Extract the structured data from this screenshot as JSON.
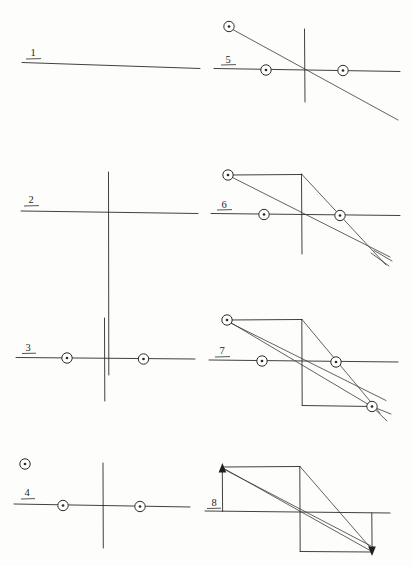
{
  "sheet": {
    "title": "Geometric construction sequence",
    "background_color": "#fdfdfc",
    "ink_color": "#2b2b2b",
    "width": 412,
    "height": 566,
    "media": "hand-drawn pencil on paper, scanned"
  },
  "panels": [
    {
      "label": "1",
      "label_x": 33,
      "label_y": 55,
      "name": "panel-1",
      "description": "single horizontal reference line",
      "elements": [
        "horizontal-axis"
      ]
    },
    {
      "label": "2",
      "label_x": 29,
      "label_y": 201,
      "name": "panel-2",
      "description": "horizontal line crossed by a vertical line",
      "elements": [
        "horizontal-axis",
        "vertical-axis"
      ]
    },
    {
      "label": "3",
      "label_x": 27,
      "label_y": 349,
      "name": "panel-3",
      "description": "axes plus two circled point markers on the horizontal line",
      "elements": [
        "horizontal-axis",
        "vertical-axis",
        "marker-left",
        "marker-right"
      ]
    },
    {
      "label": "4",
      "label_x": 27,
      "label_y": 494,
      "name": "panel-4",
      "description": "axes, two circled markers on the line, plus one free circled marker above left",
      "elements": [
        "horizontal-axis",
        "vertical-axis",
        "marker-left",
        "marker-right",
        "marker-floating"
      ]
    },
    {
      "label": "5",
      "label_x": 228,
      "label_y": 62,
      "name": "panel-5",
      "description": "axes with three circled markers and one oblique line through the origin",
      "elements": [
        "horizontal-axis",
        "vertical-axis",
        "oblique-line",
        "marker-upper-left",
        "marker-left",
        "marker-right"
      ]
    },
    {
      "label": "6",
      "label_x": 224,
      "label_y": 211,
      "name": "panel-6",
      "description": "adds a top horizontal edge and a second converging oblique line",
      "elements": [
        "horizontal-axis",
        "vertical-axis",
        "top-edge",
        "oblique-line-a",
        "oblique-line-b",
        "marker-upper-left",
        "marker-left",
        "marker-right"
      ]
    },
    {
      "label": "7",
      "label_x": 222,
      "label_y": 355,
      "name": "panel-7",
      "description": "closed parallelogram with crossing diagonals and four circled markers",
      "elements": [
        "horizontal-axis",
        "vertical-edge",
        "top-edge",
        "bottom-edge",
        "diagonal-a",
        "diagonal-b",
        "diagonal-c",
        "marker-upper-left",
        "marker-left",
        "marker-right",
        "marker-lower-right"
      ]
    },
    {
      "label": "8",
      "label_x": 214,
      "label_y": 505,
      "name": "panel-8",
      "description": "same parallelogram with vector arrowheads replacing the circled markers",
      "elements": [
        "horizontal-axis",
        "vertical-edge",
        "top-edge",
        "bottom-edge",
        "diagonal-a",
        "diagonal-b",
        "diagonal-c",
        "arrow-up",
        "arrow-down"
      ]
    }
  ],
  "marker_legend": {
    "circled_dot": "circled-dot marker (small open circle with a filled centre point)",
    "arrow_up": "upward vector arrowhead",
    "arrow_down": "downward vector arrowhead"
  }
}
